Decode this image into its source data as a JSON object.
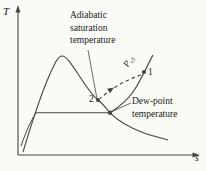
{
  "colors": {
    "bg": "#fafaf7",
    "line": "#454545",
    "text": "#222222"
  },
  "diagram": {
    "type": "thermodynamic T-s sketch: adiabatic saturation process",
    "y_axis_label": "T",
    "x_axis_label": "s",
    "labels": {
      "adiabatic_saturation": "Adiabatic\nsaturation\ntemperature",
      "dew_point": "Dew-point\ntemperature",
      "isobar_p": "P",
      "isobar_sub": "v1",
      "point_1": "1",
      "point_2": "2"
    }
  }
}
